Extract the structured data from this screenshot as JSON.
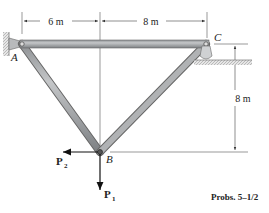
{
  "diagram": {
    "type": "truss",
    "nodes": {
      "A": {
        "label": "A",
        "support": "pin"
      },
      "B": {
        "label": "B",
        "support": "none"
      },
      "C": {
        "label": "C",
        "support": "rocker"
      }
    },
    "members": [
      {
        "from": "A",
        "to": "C"
      },
      {
        "from": "A",
        "to": "B"
      },
      {
        "from": "B",
        "to": "C"
      }
    ],
    "dimensions": {
      "horizontal_left": "6 m",
      "horizontal_right": "8 m",
      "vertical": "8 m"
    },
    "loads": {
      "P1": {
        "label": "P",
        "subscript": "1",
        "direction": "down"
      },
      "P2": {
        "label": "P",
        "subscript": "2",
        "direction": "left"
      }
    },
    "caption": "Probs. 5–1/2"
  }
}
